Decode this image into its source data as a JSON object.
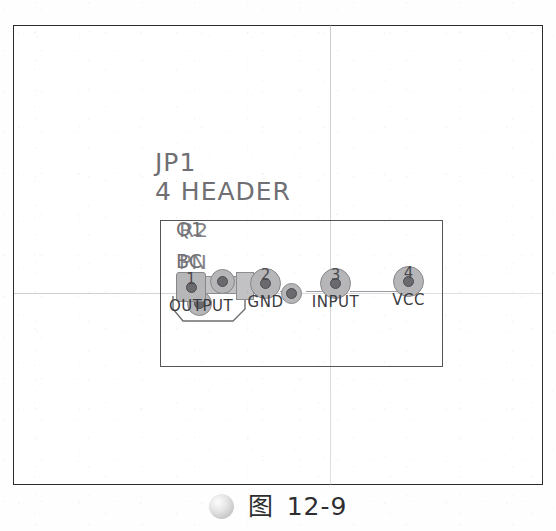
{
  "figure": {
    "domain_kind": "pcb-footprint-drawing",
    "caption": {
      "bullet_icon": "gray-sphere-icon",
      "cjk_label": "图",
      "number": "12-9"
    }
  },
  "frame": {
    "border_color": "#2c2c2c",
    "crosshair_color": "#a8a8b0"
  },
  "component": {
    "reference_designator": "JP1",
    "value": "4 HEADER",
    "overlay_designators": [
      {
        "line": 1,
        "text_a": "Q1",
        "text_b": "R2"
      },
      {
        "line": 2,
        "text_a": "BC",
        "text_b": "PN"
      }
    ],
    "outline_color": "#555558"
  },
  "pads": [
    {
      "number": "1",
      "name": "OUTPUT",
      "shape": "square",
      "x": 176,
      "y": 278
    },
    {
      "number": "2",
      "name": "GND",
      "shape": "round",
      "x": 250,
      "y": 274
    },
    {
      "number": "3",
      "name": "INPUT",
      "shape": "round",
      "x": 320,
      "y": 274
    },
    {
      "number": "4",
      "name": "VCC",
      "shape": "round",
      "x": 393,
      "y": 272
    }
  ],
  "extra_pads": [
    {
      "name": "transistor-pad-center",
      "x": 222,
      "y": 281
    },
    {
      "name": "transistor-pad-lower",
      "x": 199,
      "y": 303
    },
    {
      "name": "via-pad",
      "x": 293,
      "y": 284
    }
  ],
  "colors": {
    "pad_fill": "#b6b6b8",
    "pad_hole": "#6a6a6e",
    "silkscreen_text": "#6f6f74",
    "pad_label_text": "#3b3b3f",
    "trace": "#9a9aa0"
  }
}
